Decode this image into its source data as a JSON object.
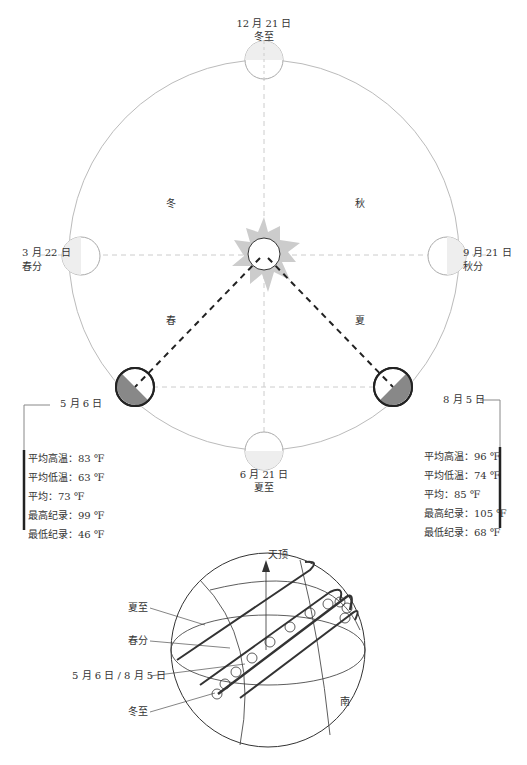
{
  "title_points": {
    "winter_solstice": {
      "date": "12 月 21 日",
      "name": "冬至"
    },
    "spring_equinox": {
      "date": "3 月 22 日",
      "name": "春分"
    },
    "autumn_equinox": {
      "date": "9 月 21 日",
      "name": "秋分"
    },
    "summer_solstice": {
      "date": "6 月 21 日",
      "name": "夏至"
    }
  },
  "seasons": {
    "winter": "冬",
    "autumn": "秋",
    "spring": "春",
    "summer": "夏"
  },
  "left_panel": {
    "date": "5 月 6 日",
    "stats": [
      "平均高温：83 ℉",
      "平均低温：63 ℉",
      "平均：73 ℉",
      "最高纪录：99 ℉",
      "最低纪录：46 ℉"
    ]
  },
  "right_panel": {
    "date": "8 月 5 日",
    "stats": [
      "平均高温：96 ℉",
      "平均低温：74 ℉",
      "平均：85 ℉",
      "最高纪录：105 ℉",
      "最低纪录：68 ℉"
    ]
  },
  "sphere": {
    "zenith": "天顶",
    "south": "南",
    "legend": [
      "夏至",
      "春分",
      "5 月 6 日 / 8 月 5 日",
      "冬至"
    ]
  },
  "colors": {
    "orbit": "#bbbbbb",
    "sun": "#cccccc",
    "shade": "#888888",
    "ink": "#222222"
  }
}
